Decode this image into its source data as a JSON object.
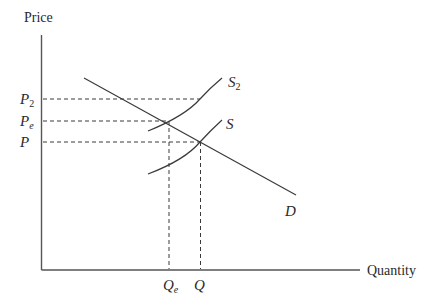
{
  "diagram": {
    "axes": {
      "y_label": "Price",
      "x_label": "Quantity"
    },
    "price_labels": {
      "p2": {
        "base": "P",
        "sub": "2"
      },
      "pe": {
        "base": "P",
        "sub": "e"
      },
      "p": {
        "base": "P",
        "sub": ""
      }
    },
    "quantity_labels": {
      "qe": {
        "base": "Q",
        "sub": "e"
      },
      "q": {
        "base": "Q",
        "sub": ""
      }
    },
    "curves": {
      "s2": {
        "base": "S",
        "sub": "2",
        "type": "supply (shifted)"
      },
      "s": {
        "base": "S",
        "sub": "",
        "type": "supply"
      },
      "d": {
        "base": "D",
        "sub": "",
        "type": "demand"
      }
    },
    "relationships": [
      "Equilibrium of S2 and D at (Qe, Pe)",
      "Equilibrium of S and D at (Q, P)",
      "S2 at quantity Q corresponds to price P2"
    ]
  }
}
